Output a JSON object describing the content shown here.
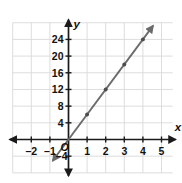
{
  "figure": {
    "kind": "coordinate-plane-line-graph",
    "axis_labels": {
      "x": "x",
      "y": "y"
    },
    "origin_label": "O",
    "colors": {
      "grid": "#d9d9d9",
      "axis": "#1a1a1a",
      "line": "#6b6b6b",
      "point": "#4d4d4d",
      "text": "#111111",
      "background": "#ffffff"
    }
  },
  "chart_data": {
    "type": "line",
    "title": "",
    "xlabel": "x",
    "ylabel": "y",
    "grid": true,
    "legend": "none",
    "xlim": [
      -3,
      5.6
    ],
    "ylim": [
      -8,
      28
    ],
    "xticks": [
      -2,
      -1,
      1,
      2,
      3,
      4,
      5
    ],
    "xticklabels": [
      "–2",
      "–1",
      "1",
      "2",
      "3",
      "4",
      "5"
    ],
    "yticks": [
      -4,
      4,
      8,
      12,
      16,
      20,
      24
    ],
    "yticklabels": [
      "–4",
      "4",
      "8",
      "12",
      "16",
      "20",
      "24"
    ],
    "x_gridlines": [
      -3,
      -2,
      -1,
      0,
      1,
      2,
      3,
      4,
      5
    ],
    "y_gridlines": [
      -8,
      -4,
      0,
      4,
      8,
      12,
      16,
      20,
      24,
      28
    ],
    "series": [
      {
        "name": "y = 6x",
        "slope": 6,
        "intercept": 0,
        "arrows": "both",
        "x": [
          0,
          1,
          2,
          3,
          4
        ],
        "values": [
          0,
          6,
          12,
          18,
          24
        ],
        "marked_points": [
          {
            "x": 1,
            "y": 6
          },
          {
            "x": 2,
            "y": 12
          },
          {
            "x": 3,
            "y": 18
          },
          {
            "x": 4,
            "y": 24
          }
        ],
        "line_from": {
          "x": -0.85,
          "y": -5.1
        },
        "line_to": {
          "x": 4.55,
          "y": 27.3
        }
      }
    ]
  }
}
